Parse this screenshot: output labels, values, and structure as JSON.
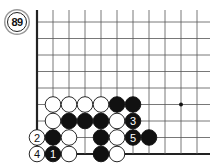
{
  "diagram": {
    "number_badge": "89",
    "board": {
      "origin_x": 37,
      "origin_y": 22,
      "spacing_x": 16,
      "spacing_y": 16.5,
      "cols": 11,
      "rows": 9,
      "right_edge_x": 210,
      "left_edge": "thick",
      "bottom_edge": "thick",
      "star_points": [
        {
          "col": 9,
          "row": 5
        }
      ]
    },
    "stones": [
      {
        "col": 1,
        "row": 5,
        "color": "white",
        "label": ""
      },
      {
        "col": 2,
        "row": 5,
        "color": "white",
        "label": ""
      },
      {
        "col": 3,
        "row": 5,
        "color": "white",
        "label": ""
      },
      {
        "col": 4,
        "row": 5,
        "color": "white",
        "label": ""
      },
      {
        "col": 5,
        "row": 5,
        "color": "black",
        "label": ""
      },
      {
        "col": 6,
        "row": 5,
        "color": "black",
        "label": ""
      },
      {
        "col": 1,
        "row": 6,
        "color": "white",
        "label": ""
      },
      {
        "col": 2,
        "row": 6,
        "color": "black",
        "label": ""
      },
      {
        "col": 3,
        "row": 6,
        "color": "black",
        "label": ""
      },
      {
        "col": 4,
        "row": 6,
        "color": "black",
        "label": ""
      },
      {
        "col": 5,
        "row": 6,
        "color": "white",
        "label": ""
      },
      {
        "col": 6,
        "row": 6,
        "color": "black",
        "label": "3"
      },
      {
        "col": 0,
        "row": 7,
        "color": "white",
        "label": "2"
      },
      {
        "col": 1,
        "row": 7,
        "color": "black",
        "label": ""
      },
      {
        "col": 2,
        "row": 7,
        "color": "white",
        "label": ""
      },
      {
        "col": 4,
        "row": 7,
        "color": "black",
        "label": ""
      },
      {
        "col": 5,
        "row": 7,
        "color": "white",
        "label": ""
      },
      {
        "col": 6,
        "row": 7,
        "color": "black",
        "label": "5"
      },
      {
        "col": 7,
        "row": 7,
        "color": "black",
        "label": ""
      },
      {
        "col": 0,
        "row": 8,
        "color": "white",
        "label": "4"
      },
      {
        "col": 1,
        "row": 8,
        "color": "black",
        "label": "1"
      },
      {
        "col": 2,
        "row": 8,
        "color": "white",
        "label": ""
      },
      {
        "col": 4,
        "row": 8,
        "color": "black",
        "label": ""
      },
      {
        "col": 5,
        "row": 8,
        "color": "white",
        "label": ""
      }
    ],
    "colors": {
      "line": "#555555",
      "edge": "#222222",
      "black_stone": "#111111",
      "white_stone": "#ffffff"
    }
  }
}
